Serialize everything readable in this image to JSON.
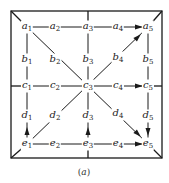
{
  "caption": {
    "open": "(",
    "letter": "a",
    "close": ")"
  },
  "colors": {
    "line": "#1a1a1a",
    "background": "#ffffff"
  },
  "frame": {
    "x1": 11,
    "y1": 11,
    "x2": 162,
    "y2": 158
  },
  "nodes": [
    {
      "id": "a1",
      "base": "a",
      "sub": "1",
      "x": 27,
      "y": 27
    },
    {
      "id": "a2",
      "base": "a",
      "sub": "2",
      "x": 55,
      "y": 27
    },
    {
      "id": "a3",
      "base": "a",
      "sub": "3",
      "x": 88,
      "y": 27
    },
    {
      "id": "a4",
      "base": "a",
      "sub": "4",
      "x": 118,
      "y": 27
    },
    {
      "id": "a5",
      "base": "a",
      "sub": "5",
      "x": 148,
      "y": 27
    },
    {
      "id": "b1",
      "base": "b",
      "sub": "1",
      "x": 27,
      "y": 60
    },
    {
      "id": "b2",
      "base": "b",
      "sub": "2",
      "x": 55,
      "y": 60
    },
    {
      "id": "b3",
      "base": "b",
      "sub": "3",
      "x": 88,
      "y": 60
    },
    {
      "id": "b4",
      "base": "b",
      "sub": "4",
      "x": 118,
      "y": 58
    },
    {
      "id": "b5",
      "base": "b",
      "sub": "5",
      "x": 148,
      "y": 60
    },
    {
      "id": "c1",
      "base": "c",
      "sub": "1",
      "x": 27,
      "y": 86
    },
    {
      "id": "c2",
      "base": "c",
      "sub": "2",
      "x": 55,
      "y": 86
    },
    {
      "id": "c3",
      "base": "c",
      "sub": "3",
      "x": 88,
      "y": 86
    },
    {
      "id": "c4",
      "base": "c",
      "sub": "4",
      "x": 118,
      "y": 86
    },
    {
      "id": "c5",
      "base": "c",
      "sub": "5",
      "x": 148,
      "y": 86
    },
    {
      "id": "d1",
      "base": "d",
      "sub": "1",
      "x": 27,
      "y": 116
    },
    {
      "id": "d2",
      "base": "d",
      "sub": "2",
      "x": 55,
      "y": 116
    },
    {
      "id": "d3",
      "base": "d",
      "sub": "3",
      "x": 88,
      "y": 116
    },
    {
      "id": "d4",
      "base": "d",
      "sub": "4",
      "x": 118,
      "y": 114
    },
    {
      "id": "d5",
      "base": "d",
      "sub": "5",
      "x": 148,
      "y": 116
    },
    {
      "id": "e1",
      "base": "e",
      "sub": "1",
      "x": 27,
      "y": 144
    },
    {
      "id": "e2",
      "base": "e",
      "sub": "2",
      "x": 55,
      "y": 144
    },
    {
      "id": "e3",
      "base": "e",
      "sub": "3",
      "x": 88,
      "y": 144
    },
    {
      "id": "e4",
      "base": "e",
      "sub": "4",
      "x": 118,
      "y": 144
    },
    {
      "id": "e5",
      "base": "e",
      "sub": "5",
      "x": 148,
      "y": 144
    }
  ],
  "edges": [
    {
      "from": "a1",
      "to": "a5",
      "type": "line"
    },
    {
      "from": "c1",
      "to": "c5",
      "type": "line"
    },
    {
      "from": "e1",
      "to": "e5",
      "type": "line"
    },
    {
      "from": "a1",
      "to": "e1",
      "type": "line"
    },
    {
      "from": "a3",
      "to": "e3",
      "type": "line"
    },
    {
      "from": "a5",
      "to": "e5",
      "type": "line"
    },
    {
      "from": "a1",
      "to": "e5",
      "type": "line"
    },
    {
      "from": "e1",
      "to": "a5",
      "type": "line"
    }
  ],
  "arrows": [
    {
      "label": "a4 to a5",
      "x": 139,
      "y": 27,
      "dir": "right"
    },
    {
      "label": "b4 to a5",
      "x": 138,
      "y": 37,
      "dir": "up-right"
    },
    {
      "label": "c4 to c5",
      "x": 139,
      "y": 86,
      "dir": "right"
    },
    {
      "label": "d1 up",
      "x": 27,
      "y": 131,
      "dir": "up"
    },
    {
      "label": "d3 up",
      "x": 88,
      "y": 131,
      "dir": "up"
    },
    {
      "label": "d5 down",
      "x": 148,
      "y": 132,
      "dir": "down"
    },
    {
      "label": "d4 to e5",
      "x": 138,
      "y": 134,
      "dir": "down-right"
    },
    {
      "label": "e4 to e5",
      "x": 139,
      "y": 144,
      "dir": "right"
    }
  ]
}
